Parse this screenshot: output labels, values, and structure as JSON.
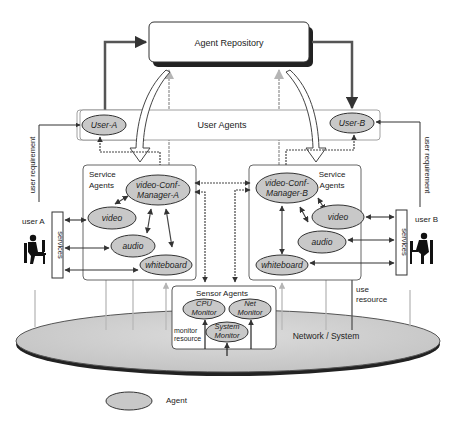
{
  "repository": {
    "label": "Agent Repository"
  },
  "user_agents": {
    "label": "User Agents",
    "user_a": "User-A",
    "user_b": "User-B"
  },
  "service_agents_a": {
    "label_line1": "Service",
    "label_line2": "Agents",
    "manager_line1": "video-Conf-",
    "manager_line2": "Manager-A",
    "video": "video",
    "audio": "audio",
    "whiteboard": "whiteboard"
  },
  "service_agents_b": {
    "label_line1": "Service",
    "label_line2": "Agents",
    "manager_line1": "video-Conf-",
    "manager_line2": "Manager-B",
    "video": "video",
    "audio": "audio",
    "whiteboard": "whiteboard"
  },
  "sensor_agents": {
    "label": "Sensor Agents",
    "cpu_line1": "CPU",
    "cpu_line2": "Monitor",
    "net_line1": "Net",
    "net_line2": "Monitor",
    "sys_line1": "System",
    "sys_line2": "Monitor"
  },
  "users": {
    "user_a": "user A",
    "user_b": "user B",
    "services_a": "services",
    "services_b": "services",
    "user_requirement_a": "user requirement",
    "user_requirement_b": "user requirement"
  },
  "annotations": {
    "monitor_line1": "monitor",
    "monitor_line2": "resource",
    "use_line1": "use",
    "use_line2": "resource",
    "network": "Network / System"
  },
  "legend": {
    "label": "Agent"
  },
  "colors": {
    "agent_fill": "#c8c8c8",
    "line": "#333333",
    "light_arrow": "#bbbbbb",
    "network_fill": "#d2d2d2"
  }
}
